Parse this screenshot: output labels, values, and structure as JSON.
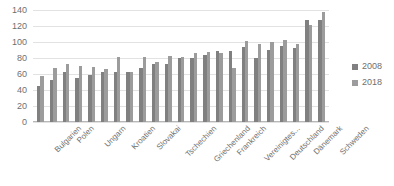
{
  "chart_data": {
    "type": "bar",
    "title": "",
    "xlabel": "",
    "ylabel": "",
    "ylim": [
      0,
      140
    ],
    "yticks": [
      0,
      20,
      40,
      60,
      80,
      100,
      120,
      140
    ],
    "grid": true,
    "legend_position": "right",
    "categories": [
      "Bulgarien",
      "Rumänien",
      "Polen",
      "Litauen",
      "Ungarn",
      "Lettland",
      "Kroatien",
      "Estland",
      "Slovakei",
      "Portugal",
      "Tschechien",
      "Spanien",
      "Griechenland",
      "Italien",
      "Frankreich",
      "Belgien",
      "Vereinigtes...",
      "Österreich",
      "Deutschland",
      "Finnland",
      "Dänemark",
      "Niederlande",
      "Schweden"
    ],
    "axis_labels_shown": [
      "Bulgarien",
      "Polen",
      "Ungarn",
      "Kroatien",
      "Slovakai",
      "Tschechien",
      "Griechenland",
      "Frankreich",
      "Vereinigtes...",
      "Deutschland",
      "Dänemark",
      "Schweden"
    ],
    "series": [
      {
        "name": "2008",
        "color": "#808080",
        "values": [
          45,
          52,
          63,
          55,
          59,
          62,
          62,
          62,
          68,
          72,
          72,
          80,
          80,
          84,
          89,
          89,
          94,
          80,
          90,
          95,
          93,
          128,
          128
        ]
      },
      {
        "name": "2018",
        "color": "#9c9c9c",
        "values": [
          57,
          68,
          72,
          70,
          69,
          66,
          81,
          62,
          81,
          75,
          82,
          81,
          86,
          87,
          86,
          68,
          101,
          98,
          100,
          103,
          97,
          121,
          138
        ]
      }
    ]
  },
  "legend": {
    "items": [
      {
        "label": "2008"
      },
      {
        "label": "2018"
      }
    ]
  }
}
